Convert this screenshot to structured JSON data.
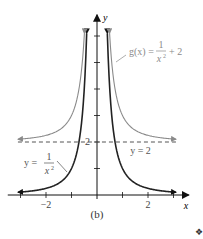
{
  "chart_data": {
    "type": "line",
    "title": "",
    "caption": "(b)",
    "xlabel": "x",
    "ylabel": "y",
    "xlim": [
      -3.1,
      3.1
    ],
    "ylim": [
      0,
      6.1
    ],
    "x_axis_extent": [
      -3.5,
      3.6
    ],
    "y_axis_extent": [
      0,
      6.8
    ],
    "x_ticks": [
      -3,
      -2,
      -1,
      1,
      2,
      3
    ],
    "x_tick_labels": [
      {
        "value": -2,
        "label": "−2"
      },
      {
        "value": 2,
        "label": "2"
      }
    ],
    "y_ticks": [
      1,
      2,
      3,
      4,
      5,
      6
    ],
    "y_tick_labels": [
      {
        "value": 2,
        "label": "2"
      }
    ],
    "grid": false,
    "series": [
      {
        "name": "y = 1/x^2",
        "formula": "1/x^2",
        "color": "#222222",
        "label_parts": {
          "lhs": "y =",
          "num": "1",
          "den": "x",
          "exp": "2"
        },
        "domain": [
          -3.1,
          3.1
        ],
        "y_max": 6.1
      },
      {
        "name": "g(x) = 1/x^2 + 2",
        "formula": "1/x^2 + 2",
        "color": "#8a8a8a",
        "label_parts": {
          "lhs": "g(x) =",
          "num": "1",
          "den": "x",
          "exp": "2",
          "rhs": "+ 2"
        },
        "domain": [
          -3.1,
          3.1
        ],
        "y_max": 6.1
      }
    ],
    "asymptotes": [
      {
        "type": "horizontal",
        "y": 2,
        "label": "y = 2",
        "style": "dashed",
        "color": "#555555"
      }
    ]
  },
  "footer": {
    "end_marker": "❖"
  }
}
